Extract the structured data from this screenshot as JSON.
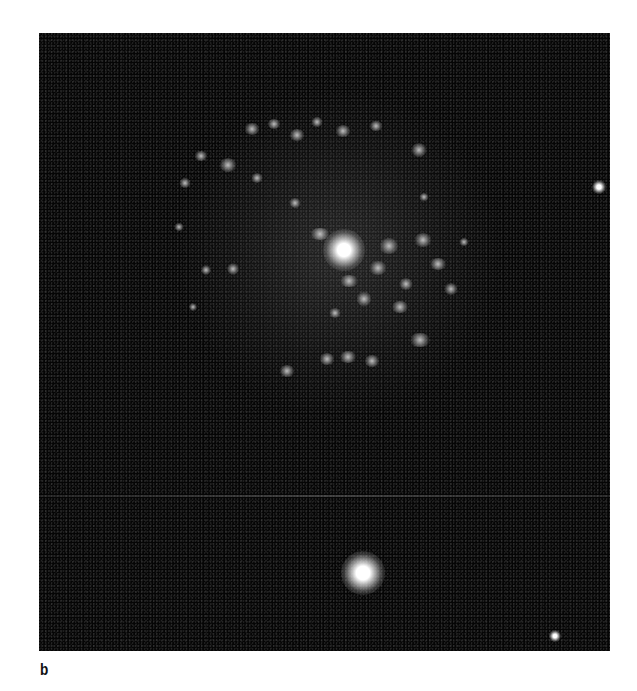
{
  "figure": {
    "panel_label": "b",
    "image_description": "Grayscale astronomical image of a face-on spiral galaxy with a bright nucleus and clumpy arms; a bright foreground star below; two faint point sources at right edge",
    "colors": {
      "background": "#050505",
      "page": "#ffffff",
      "label": "#111111"
    }
  }
}
